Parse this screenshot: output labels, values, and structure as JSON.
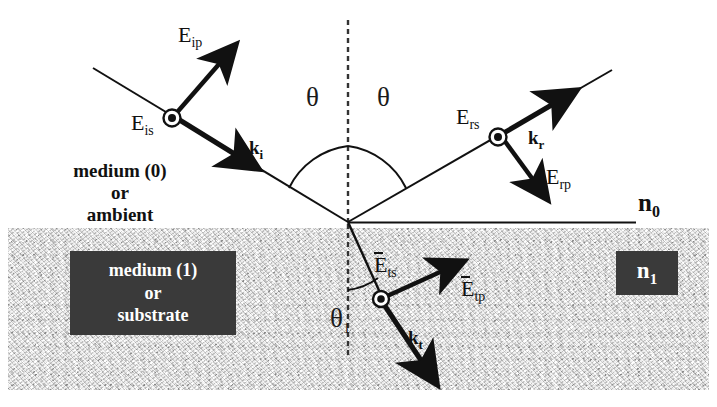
{
  "figure": {
    "type": "optics-ray-diagram"
  },
  "media": {
    "upper_label_line1": "medium (0)",
    "upper_label_line2": "or",
    "upper_label_line3": "ambient",
    "lower_label_line1": "medium   (1)",
    "lower_label_line2": "or",
    "lower_label_line3": "substrate",
    "upper_index": "n",
    "upper_index_sub": "0",
    "lower_index": "n",
    "lower_index_sub": "1"
  },
  "angles": {
    "incident": "θ",
    "reflected": "θ",
    "transmitted": "θ",
    "transmitted_sub": "1"
  },
  "fields": {
    "incident_p": "E",
    "incident_p_sub": "ip",
    "incident_s": "E",
    "incident_s_sub": "is",
    "reflected_s": "E",
    "reflected_s_sub": "rs",
    "reflected_p": "E",
    "reflected_p_sub": "rp",
    "transmitted_s": "E",
    "transmitted_s_sub": "ts",
    "transmitted_p": "E",
    "transmitted_p_sub": "tp"
  },
  "wavevectors": {
    "incident": "k",
    "incident_sub": "i",
    "reflected": "k",
    "reflected_sub": "r",
    "transmitted": "k",
    "transmitted_sub": "t"
  },
  "colors": {
    "ray": "#111111",
    "substrate_fill": "#dcdcdc",
    "box_fill": "#3a3a3a",
    "box_text": "#ffffff",
    "background": "#ffffff"
  }
}
